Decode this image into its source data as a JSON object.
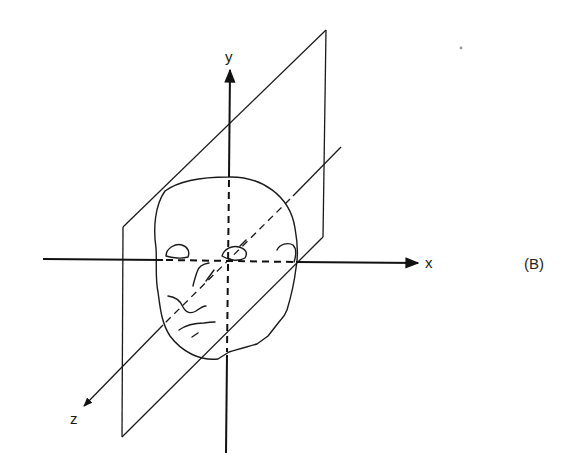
{
  "figure": {
    "panel_label": "(B)",
    "axes": {
      "x": {
        "label": "x"
      },
      "y": {
        "label": "y"
      },
      "z": {
        "label": "z"
      }
    },
    "elements": [
      "sagittal-plane",
      "head-outline",
      "x-axis",
      "y-axis",
      "z-axis"
    ],
    "colors": {
      "ink": "#111111",
      "background": "#ffffff"
    }
  }
}
